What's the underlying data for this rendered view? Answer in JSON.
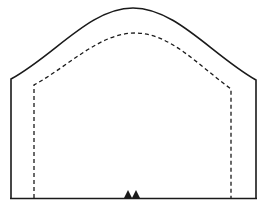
{
  "diagram": {
    "type": "tunnel-cross-section",
    "colors": {
      "background": "#ffffff",
      "stroke": "#1a1a1a"
    },
    "elements": [
      {
        "name": "outer-profile",
        "style": "solid"
      },
      {
        "name": "inner-clearance-profile",
        "style": "dashed"
      },
      {
        "name": "ground-line",
        "style": "solid"
      },
      {
        "name": "center-markers",
        "count": 2,
        "shape": "triangle"
      }
    ]
  }
}
